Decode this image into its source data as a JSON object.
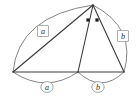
{
  "figure": {
    "background_color": "#ffffff",
    "line_color": "#3a3a3a",
    "arc_color": "#6f6f6f",
    "label_box_border_color": "#9a9a9a",
    "label_text_color": "#2a2a2a",
    "angle_marker_color": "#1d1d1d"
  },
  "vertices": {
    "apex": {
      "name": "apex",
      "x": 93,
      "y": 5
    },
    "bottom_left": {
      "name": "bottom-left",
      "x": 13,
      "y": 72
    },
    "bottom_middle": {
      "name": "bottom-middle",
      "x": 78,
      "y": 72
    },
    "bottom_right": {
      "name": "bottom-right",
      "x": 124,
      "y": 72
    }
  },
  "segments": [
    {
      "name": "left-side",
      "from": "bottom_left",
      "to": "apex"
    },
    {
      "name": "cevian",
      "from": "apex",
      "to": "bottom_middle"
    },
    {
      "name": "right-side",
      "from": "apex",
      "to": "bottom_right"
    },
    {
      "name": "base-left",
      "from": "bottom_left",
      "to": "bottom_middle"
    },
    {
      "name": "base-right",
      "from": "bottom_middle",
      "to": "bottom_right"
    }
  ],
  "arcs": [
    {
      "name": "arc-upper-left",
      "label": "a",
      "label_style": "box",
      "label_x": 43,
      "label_y": 31
    },
    {
      "name": "arc-upper-right",
      "label": "b",
      "label_style": "box",
      "label_x": 123,
      "label_y": 36
    },
    {
      "name": "arc-lower-left",
      "label": "a",
      "label_style": "circle",
      "label_x": 47,
      "label_y": 87
    },
    {
      "name": "arc-lower-right",
      "label": "b",
      "label_style": "circle",
      "label_x": 98,
      "label_y": 87
    }
  ],
  "angle_markers": [
    {
      "name": "angle-dot-left",
      "x": 88,
      "y": 20
    },
    {
      "name": "angle-dot-right",
      "x": 97,
      "y": 20
    }
  ],
  "labels": {
    "box_a": "a",
    "box_b": "b",
    "circle_a": "a",
    "circle_b": "b"
  }
}
